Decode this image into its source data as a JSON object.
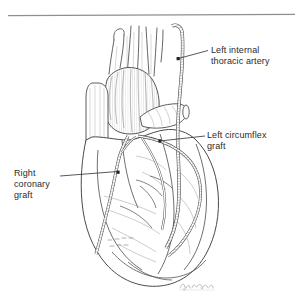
{
  "figure": {
    "kind": "medical-line-illustration",
    "background_color": "#ffffff",
    "ink_color": "#3a3a3a",
    "text_color": "#2b2b2b",
    "signature": "J. Bartel"
  },
  "top_rule": {
    "present": true
  },
  "labels": {
    "left_internal_thoracic_artery": "Left internal\nthoracic artery",
    "left_circumflex_graft": "Left circumflex\ngraft",
    "right_coronary_graft": "Right\ncoronary\ngraft"
  },
  "leader_lines": {
    "lita": "leader-line-lita",
    "lcx": "leader-line-lcx",
    "rca": "leader-line-rca"
  },
  "anatomy": {
    "great_vessels": "great-vessels",
    "aorta": "ascending-aorta",
    "pulmonary_artery": "pulmonary-artery-stump",
    "right_atrium": "right-atrium",
    "right_ventricle": "right-ventricle",
    "left_ventricle": "left-ventricle",
    "apex": "cardiac-apex"
  },
  "grafts": {
    "lita_graft": "left-internal-thoracic-artery-graft",
    "circumflex_graft": "left-circumflex-bypass-graft",
    "rca_graft": "right-coronary-bypass-graft"
  }
}
